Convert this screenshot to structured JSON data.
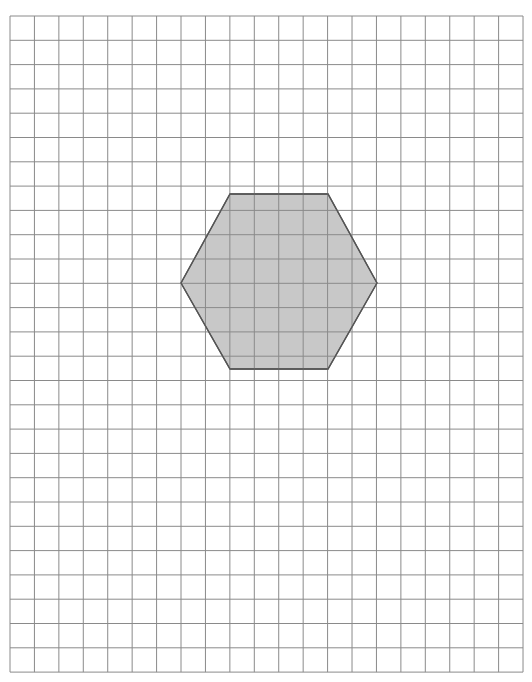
{
  "header": {
    "cutoff_text": ""
  },
  "grid": {
    "left": 10,
    "top": 16,
    "cols": 21,
    "rows": 27,
    "cell_w": 24.43,
    "cell_h": 24.3,
    "line_color": "#8a8a8a"
  },
  "shape": {
    "type": "hexagon",
    "points": [
      [
        230,
        194
      ],
      [
        328,
        194
      ],
      [
        377,
        283
      ],
      [
        328,
        369
      ],
      [
        230,
        369
      ],
      [
        181,
        283
      ]
    ],
    "fill": "#c8c8c8",
    "stroke": "#555555"
  }
}
